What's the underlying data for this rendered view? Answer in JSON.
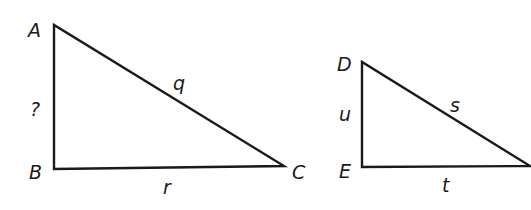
{
  "diagram": {
    "type": "similar-right-triangles",
    "triangles": [
      {
        "name": "triangle-ABC",
        "vertices": {
          "top": "A",
          "right_angle": "B",
          "far": "C"
        },
        "sides": {
          "vertical": "?",
          "hypotenuse": "q",
          "horizontal": "r"
        }
      },
      {
        "name": "triangle-DEF",
        "vertices": {
          "top": "D",
          "right_angle": "E"
        },
        "sides": {
          "vertical": "u",
          "hypotenuse": "s",
          "horizontal": "t"
        }
      }
    ]
  }
}
